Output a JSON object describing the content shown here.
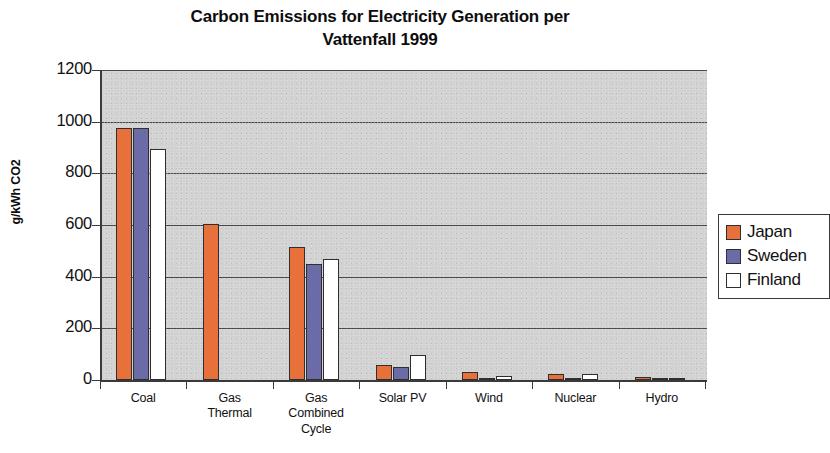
{
  "chart_data": {
    "type": "bar",
    "title": "Carbon Emissions for Electricity Generation per Vattenfall 1999",
    "title_line1": "Carbon Emissions for Electricity Generation per",
    "title_line2": "Vattenfall 1999",
    "xlabel": "",
    "ylabel": "g/kWh CO2",
    "ylim": [
      0,
      1200
    ],
    "ytick_step": 200,
    "yticks": [
      0,
      200,
      400,
      600,
      800,
      1000,
      1200
    ],
    "ytick_labels": [
      "0",
      "200",
      "400",
      "600",
      "800",
      "1000",
      "1200"
    ],
    "grid": true,
    "grid_axis": "y",
    "legend_position": "right",
    "plot_background": "#d2d2d2",
    "categories": [
      "Coal",
      "Gas Thermal",
      "Gas Combined Cycle",
      "Solar PV",
      "Wind",
      "Nuclear",
      "Hydro"
    ],
    "category_label_lines": [
      [
        "Coal"
      ],
      [
        "Gas",
        "Thermal"
      ],
      [
        "Gas",
        "Combined",
        "Cycle"
      ],
      [
        "Solar PV"
      ],
      [
        "Wind"
      ],
      [
        "Nuclear"
      ],
      [
        "Hydro"
      ]
    ],
    "series": [
      {
        "name": "Japan",
        "color": "#e8703a",
        "values": [
          975,
          605,
          515,
          58,
          30,
          22,
          11
        ]
      },
      {
        "name": "Sweden",
        "color": "#6b6ba8",
        "values": [
          975,
          0,
          450,
          52,
          5,
          3,
          3
        ]
      },
      {
        "name": "Finland",
        "color": "#ffffff",
        "values": [
          895,
          0,
          470,
          95,
          15,
          25,
          2
        ]
      }
    ]
  },
  "legend": {
    "items": [
      {
        "label": "Japan",
        "color": "#e8703a"
      },
      {
        "label": "Sweden",
        "color": "#6b6ba8"
      },
      {
        "label": "Finland",
        "color": "#ffffff"
      }
    ]
  }
}
